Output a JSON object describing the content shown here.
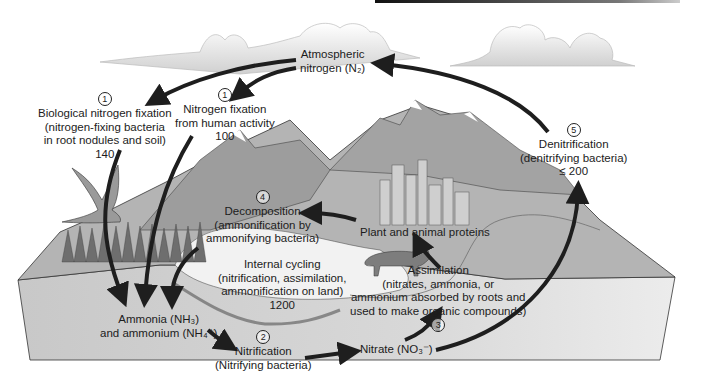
{
  "diagram": {
    "nodes": {
      "atmospheric": {
        "line1": "Atmospheric",
        "line2": "nitrogen (N₂)"
      },
      "bio_fixation": {
        "step": "1",
        "line1": "Biological nitrogen fixation",
        "line2": "(nitrogen-fixing bacteria",
        "line3": "in root nodules and soil)",
        "value": "140"
      },
      "human_fixation": {
        "step": "1",
        "line1": "Nitrogen fixation",
        "line2": "from human activity",
        "value": "100"
      },
      "denitrification": {
        "step": "5",
        "line1": "Denitrification",
        "line2": "(denitrifying bacteria)",
        "value": "≤ 200"
      },
      "decomposition": {
        "step": "4",
        "line1": "Decomposition",
        "line2": "(ammonification by",
        "line3": "ammonifying bacteria)"
      },
      "proteins": {
        "line1": "Plant and animal proteins"
      },
      "internal": {
        "line1": "Internal cycling",
        "line2": "(nitrification, assimilation,",
        "line3": "ammonification on land)",
        "value": "1200"
      },
      "assimilation": {
        "step": "3",
        "line1": "Assimilation",
        "line2": "(nitrates, ammonia, or",
        "line3": "ammonium absorbed by roots and",
        "line4": "used to make organic compounds)"
      },
      "ammonia": {
        "line1": "Ammonia (NH₃)",
        "line2": "and ammonium (NH₄⁺)"
      },
      "nitrification": {
        "step": "2",
        "line1": "Nitrification",
        "line2": "(Nitrifying bacteria)"
      },
      "nitrate": {
        "line1": "Nitrate (NO₃⁻)"
      }
    },
    "colors": {
      "arrow": "#1e1e1e",
      "land": "#bdbdbd",
      "front": "#d6d6d6",
      "mountain": "#9a9a9a",
      "water": "#f4f4f4"
    }
  }
}
